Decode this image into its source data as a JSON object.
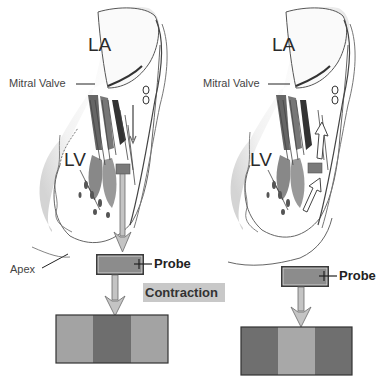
{
  "panels": [
    {
      "id": "left",
      "labels": {
        "la": "LA",
        "lv": "LV",
        "mitral_valve": "Mitral Valve",
        "apex": "Apex",
        "probe": "Probe"
      },
      "state_label": "Contraction",
      "motion": "tissue moving toward apex (away from probe view, downward arrows)",
      "strip": {
        "segments": [
          {
            "position": "left",
            "color": "#a3a3a3"
          },
          {
            "position": "center",
            "color": "#6e6e6e"
          },
          {
            "position": "right",
            "color": "#a3a3a3"
          }
        ]
      }
    },
    {
      "id": "right",
      "labels": {
        "la": "LA",
        "lv": "LV",
        "mitral_valve": "Mitral Valve",
        "probe": "Probe"
      },
      "motion": "tissue moving toward base (upward arrows)",
      "strip": {
        "segments": [
          {
            "position": "left",
            "color": "#6f6f6f"
          },
          {
            "position": "center",
            "color": "#a8a8a8"
          },
          {
            "position": "right",
            "color": "#6f6f6f"
          }
        ]
      }
    }
  ],
  "colors": {
    "sample_box": "#7a7a7a",
    "probe_fill": "#8c8c8c",
    "arrow_fill": "#c4c4c4",
    "arrow_stroke": "#6a6a6a",
    "label_bg": "#c8c8c8"
  }
}
